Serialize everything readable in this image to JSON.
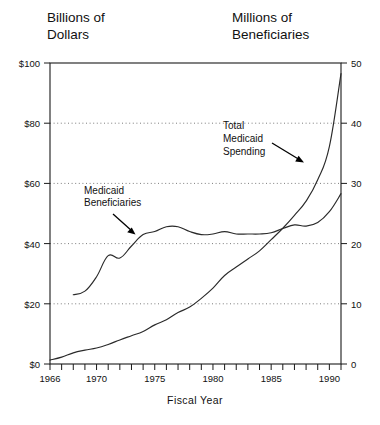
{
  "titles": {
    "left_axis_line1": "Billions of",
    "left_axis_line2": "Dollars",
    "right_axis_line1": "Millions of",
    "right_axis_line2": "Beneficiaries"
  },
  "annotations": {
    "beneficiaries": {
      "line1": "Medicaid",
      "line2": "Beneficiaries"
    },
    "spending": {
      "line1": "Total",
      "line2": "Medicaid",
      "line3": "Spending"
    }
  },
  "axes": {
    "x_title": "Fiscal Year",
    "x_ticklabels": [
      "1966",
      "1970",
      "1975",
      "1980",
      "1985",
      "1990"
    ],
    "x_tickvalues": [
      1966,
      1970,
      1975,
      1980,
      1985,
      1990
    ],
    "y_left_ticklabels": [
      "$0",
      "$20",
      "$40",
      "$60",
      "$80",
      "$100"
    ],
    "y_left_tickvalues": [
      0,
      20,
      40,
      60,
      80,
      100
    ],
    "y_right_ticklabels": [
      "0",
      "10",
      "20",
      "30",
      "40",
      "50"
    ],
    "y_right_tickvalues": [
      0,
      10,
      20,
      30,
      40,
      50
    ]
  },
  "chart_data": {
    "type": "line",
    "title": "",
    "subtitle": "",
    "xlabel": "Fiscal Year",
    "ylabel": "Billions of Dollars",
    "ylabel_right": "Millions of Beneficiaries",
    "xlim": [
      1966,
      1991
    ],
    "ylim": [
      0,
      100
    ],
    "ylim_right": [
      0,
      50
    ],
    "grid": true,
    "grid_style": "dotted-horizontal",
    "legend": "none (inline annotations with arrows)",
    "x": [
      1966,
      1967,
      1968,
      1969,
      1970,
      1971,
      1972,
      1973,
      1974,
      1975,
      1976,
      1977,
      1978,
      1979,
      1980,
      1981,
      1982,
      1983,
      1984,
      1985,
      1986,
      1987,
      1988,
      1989,
      1990,
      1991
    ],
    "series": [
      {
        "name": "Total Medicaid Spending",
        "axis": "left",
        "units": "Billions of Dollars",
        "annotation": "Total Medicaid Spending",
        "values": [
          1.3,
          2.3,
          3.7,
          4.6,
          5.3,
          6.5,
          8.0,
          9.4,
          10.8,
          13.0,
          14.7,
          17.1,
          18.9,
          21.8,
          25.2,
          29.4,
          32.2,
          34.9,
          37.6,
          41.3,
          45.1,
          49.4,
          54.1,
          61.2,
          72.2,
          96.5
        ]
      },
      {
        "name": "Medicaid Beneficiaries",
        "axis": "right",
        "units": "Millions of Beneficiaries",
        "annotation": "Medicaid Beneficiaries",
        "values": [
          null,
          null,
          11.5,
          12.1,
          14.5,
          18.0,
          17.6,
          19.6,
          21.5,
          22.0,
          22.8,
          22.8,
          22.0,
          21.5,
          21.6,
          22.0,
          21.6,
          21.6,
          21.6,
          21.8,
          22.5,
          23.1,
          22.9,
          23.5,
          25.3,
          28.3
        ]
      }
    ],
    "annotations": [
      {
        "text": "Total Medicaid Spending",
        "x": 1984.0,
        "y_display": 77,
        "arrow_to_x": 1989.3,
        "arrow_to_y_display": 62
      },
      {
        "text": "Medicaid Beneficiaries",
        "x": 1971.0,
        "y_display": 57,
        "arrow_to_x": 1974.0,
        "arrow_to_y_display": 44
      }
    ]
  },
  "colors": {
    "background": "#ffffff",
    "line": "#2a2a2a",
    "frame": "#1a1a1a",
    "grid": "#6e6e6e",
    "text": "#111111"
  }
}
